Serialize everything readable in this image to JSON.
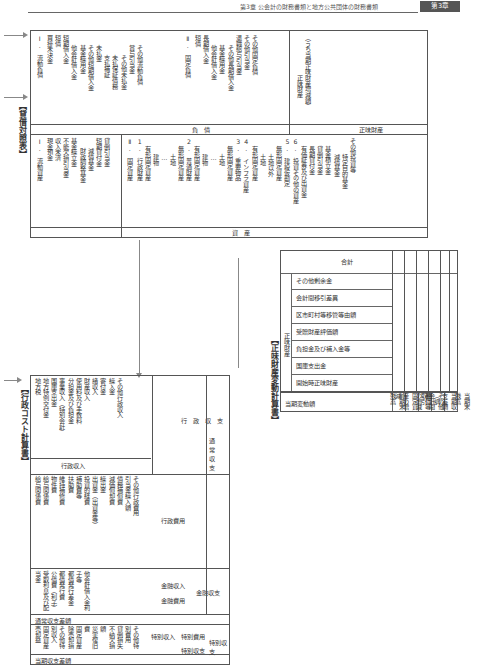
{
  "header": {
    "running_title": "第3章 公会計の財務書類と地方公共団体の財務書類",
    "chapter_badge": "第3章"
  },
  "balance_sheet": {
    "title": "【貸借対照表】",
    "section_liabilities": "負　債",
    "section_assets": "資　産",
    "section_net_assets": "正味財産",
    "current_liabilities": {
      "heading": "Ⅰ. 流動負債",
      "items": [
        "買掛未決金",
        "短債",
        "短期借入金",
        "他会計借入金",
        "基金繰用金",
        "その他短期借入金",
        "未払金",
        "支払補証",
        "未払保証債務",
        "その他未払金",
        "賞与引当金",
        "その他流動負債"
      ]
    },
    "fixed_liabilities": {
      "heading": "Ⅱ. 固定負債",
      "items": [
        "短債",
        "長期借入金",
        "他会計借入金",
        "基金繰用金",
        "その他長期借入金",
        "退職給与引当金",
        "その他引当金",
        "その他固定負債"
      ]
    },
    "net_assets": {
      "items": [
        "正味財産",
        "（うち当期正味財産増減額）"
      ]
    },
    "current_assets": {
      "heading": "Ⅰ. 流動資産",
      "items": [
        "現金預金",
        "収入未済",
        "不能欠損引当金",
        "基金繰立金",
        "財政調整基金",
        "減債基金",
        "短期貸付金",
        "貸倒引当金"
      ]
    },
    "fixed_assets": {
      "heading": "Ⅱ. 固定資産",
      "items": [
        "1. 行政財産",
        "有形固定資産",
        "建物",
        "…",
        "土地",
        "無形固定資産",
        "2. 普通財産",
        "有形固定資産",
        "建物",
        "…",
        "土地",
        "無形固定資産",
        "3. 重要物品",
        "4. インフラ資産",
        "有形固定資産",
        "土地",
        "土地以外",
        "無形固定資産",
        "5. 建設仮勘定",
        "6. 投資その他の資産",
        "有価証券及び出資金",
        "長期貸付金",
        "貸倒引当金",
        "基金積立金",
        "減債基金",
        "特定目的基金",
        "その他投資等"
      ]
    }
  },
  "net_assets_statement": {
    "title": "【正味財産変動計算書】",
    "group_label": "正味財産",
    "columns": [
      "開始時正味財産",
      "国庫支出金",
      "負担金及び補入金等",
      "受贈財産評価額",
      "区市町村等移管等由額",
      "会計間移引差異",
      "その他剰余金",
      "合計"
    ],
    "rows": [
      "前期末残高",
      "固定資産の増減",
      "都債等の増減",
      "その他会計間取引",
      "当期収支差額（調整）",
      "当期末残高"
    ],
    "row_header": "当期変動額"
  },
  "cost_statement": {
    "title": "【行政コスト計算書】",
    "major_sections": [
      "通常収支",
      "特別収支"
    ],
    "admin_revenue": {
      "label": "行政収入",
      "items": [
        "地方税",
        "地方特例交付金",
        "国庫支出金",
        "事業収入（特別会計）",
        "分担金及び負担金",
        "使用料及び手数料",
        "財産収入",
        "諸収入",
        "寄付金",
        "繰入金",
        "その他行政収入"
      ]
    },
    "admin_expense": {
      "label": "行政費用",
      "items": [
        "給与関係費",
        "給与関係費",
        "物件費",
        "維持補修費",
        "扶助費",
        "補助費等",
        "投資的経費",
        "出資金（出資金等）",
        "繰出金",
        "減価償却費",
        "債務補償費",
        "引当金繰入額",
        "その他行政費用"
      ]
    },
    "admin_balance": "行政収支",
    "financial_revenue": {
      "label": "金融収入",
      "items": [
        "受取利息及び配当金"
      ]
    },
    "financial_expense": {
      "label": "金融費用",
      "items": [
        "公債費（利子）",
        "都債発行費",
        "都債発行差金",
        "他会計借入金利子等"
      ]
    },
    "financial_balance": "金融収支",
    "ordinary_balance": "通常収支差額",
    "special_revenue": {
      "label": "特別収入",
      "items": [
        "固定資産売却益",
        "その他特別収入"
      ]
    },
    "special_expense": {
      "label": "特別費用",
      "items": [
        "固定資産除売却損",
        "災害復旧費",
        "不納欠損額",
        "貸倒損失",
        "その他特別費用"
      ]
    },
    "special_balance": "特別収支",
    "current_balance": "当期収支差額"
  }
}
